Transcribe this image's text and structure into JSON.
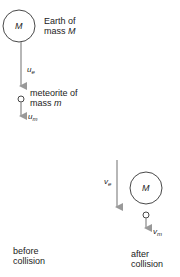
{
  "diagram": {
    "colors": {
      "arrow": "#999999",
      "circle_stroke": "#333333",
      "text": "#222222"
    },
    "before": {
      "earth": {
        "symbol": "M",
        "label_line1": "Earth of",
        "label_line2_prefix": "mass ",
        "label_line2_var": "M"
      },
      "earth_velocity": {
        "var": "u",
        "sub": "e"
      },
      "meteorite": {
        "label_line1": "meteorite of",
        "label_line2_prefix": "mass ",
        "label_line2_var": "m"
      },
      "meteorite_velocity": {
        "var": "u",
        "sub": "m"
      },
      "caption_line1": "before",
      "caption_line2": "collision"
    },
    "after": {
      "earth": {
        "symbol": "M"
      },
      "earth_velocity": {
        "var": "v",
        "sub": "e"
      },
      "meteorite_velocity": {
        "var": "v",
        "sub": "m"
      },
      "caption_line1": "after",
      "caption_line2": "collision"
    }
  }
}
